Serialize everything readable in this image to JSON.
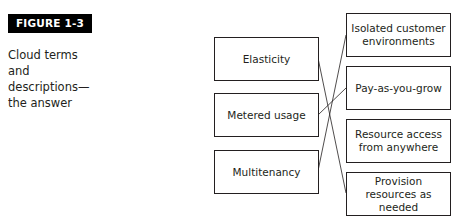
{
  "figure": {
    "label": "FIGURE 1-3",
    "caption_lines": [
      "Cloud terms and",
      "descriptions—",
      "the answer"
    ]
  },
  "terms": [
    {
      "label": "Elasticity"
    },
    {
      "label": "Metered usage"
    },
    {
      "label": "Multitenancy"
    }
  ],
  "descriptions": [
    {
      "label": "Isolated customer environments"
    },
    {
      "label": "Pay-as-you-grow"
    },
    {
      "label": "Resource access from anywhere"
    },
    {
      "label": "Provision resources as needed"
    }
  ],
  "connections": [
    {
      "term": "Elasticity",
      "description": "Provision resources as needed"
    },
    {
      "term": "Metered usage",
      "description": "Pay-as-you-grow"
    },
    {
      "term": "Multitenancy",
      "description": "Isolated customer environments"
    }
  ],
  "colors": {
    "line": "#231f20",
    "label_bg": "#000000",
    "label_text": "#ffffff"
  }
}
